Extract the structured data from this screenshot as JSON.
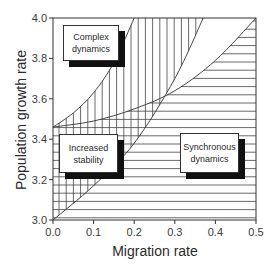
{
  "chart_data": {
    "type": "area",
    "title": "",
    "xlabel": "Migration rate",
    "ylabel": "Population growth rate",
    "xlim": [
      0.0,
      0.5
    ],
    "ylim": [
      3.0,
      4.0
    ],
    "x_ticks": [
      "0.0",
      "0.1",
      "0.2",
      "0.3",
      "0.4",
      "0.5"
    ],
    "y_ticks": [
      "3.0",
      "3.2",
      "3.4",
      "3.6",
      "3.8",
      "4.0"
    ],
    "grid": false,
    "legend": null,
    "curves": [
      {
        "name": "upper-stability-boundary",
        "x": [
          0.0,
          0.05,
          0.1,
          0.15,
          0.2
        ],
        "y": [
          3.46,
          3.53,
          3.63,
          3.78,
          4.0
        ]
      },
      {
        "name": "lower-stability-boundary",
        "x": [
          0.0,
          0.1,
          0.2,
          0.3,
          0.37
        ],
        "y": [
          3.0,
          3.17,
          3.38,
          3.7,
          4.0
        ]
      },
      {
        "name": "synchrony-boundary",
        "x": [
          0.0,
          0.1,
          0.2,
          0.3,
          0.4,
          0.5
        ],
        "y": [
          3.46,
          3.49,
          3.55,
          3.64,
          3.79,
          4.0
        ]
      }
    ],
    "regions": [
      {
        "name": "Complex dynamics",
        "hatch": "none",
        "location": "upper-left"
      },
      {
        "name": "Increased stability",
        "hatch": "vertical",
        "location": "between upper and lower stability boundaries"
      },
      {
        "name": "Synchronous dynamics",
        "hatch": "horizontal",
        "location": "below synchrony boundary"
      }
    ],
    "annotations": [
      {
        "text": "Complex\ndynamics",
        "x": 0.07,
        "y": 3.88
      },
      {
        "text": "Increased\nstability",
        "x": 0.08,
        "y": 3.37
      },
      {
        "text": "Synchronous\ndynamics",
        "x": 0.39,
        "y": 3.37
      }
    ]
  },
  "labels": {
    "complex": [
      "Complex",
      "dynamics"
    ],
    "stability": [
      "Increased",
      "stability"
    ],
    "synchronous": [
      "Synchronous",
      "dynamics"
    ]
  }
}
